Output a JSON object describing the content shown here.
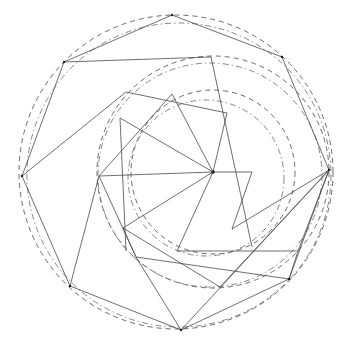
{
  "diagram": {
    "title": "",
    "background": "#ffffff",
    "stroke_color": "#4a4a4a",
    "circles": [
      {
        "name": "outer-circle-dashed",
        "cx": 176,
        "cy": 172,
        "r": 157,
        "style": "dash"
      },
      {
        "name": "outer-circle-dashdot",
        "cx": 179,
        "cy": 175,
        "r": 152,
        "style": "dashdot"
      },
      {
        "name": "middle-circle-dashed",
        "cx": 213,
        "cy": 172,
        "r": 116,
        "style": "dash"
      },
      {
        "name": "middle-circle-dashdot",
        "cx": 210,
        "cy": 175,
        "r": 112,
        "style": "dashdot"
      },
      {
        "name": "inner-circle-dashed",
        "cx": 213,
        "cy": 172,
        "r": 82,
        "style": "dash"
      },
      {
        "name": "inner-circle-dashdot",
        "cx": 206,
        "cy": 178,
        "r": 78,
        "style": "dashdot"
      }
    ],
    "vertices": [
      {
        "name": "center",
        "x": 213,
        "y": 172
      },
      {
        "name": "outer-top",
        "x": 172,
        "y": 15
      },
      {
        "name": "outer-upper-right",
        "x": 282,
        "y": 57
      },
      {
        "name": "outer-right",
        "x": 329,
        "y": 170
      },
      {
        "name": "outer-lower-right",
        "x": 289,
        "y": 279
      },
      {
        "name": "outer-bottom",
        "x": 181,
        "y": 330
      },
      {
        "name": "outer-lower-left",
        "x": 70,
        "y": 286
      },
      {
        "name": "outer-left",
        "x": 22,
        "y": 176
      },
      {
        "name": "outer-upper-left",
        "x": 64,
        "y": 62
      }
    ],
    "segments": [
      [
        22,
        176,
        64,
        62
      ],
      [
        64,
        62,
        172,
        15
      ],
      [
        172,
        15,
        282,
        57
      ],
      [
        282,
        57,
        329,
        170
      ],
      [
        329,
        170,
        289,
        279
      ],
      [
        289,
        279,
        181,
        330
      ],
      [
        181,
        330,
        70,
        286
      ],
      [
        70,
        286,
        22,
        176
      ],
      [
        64,
        62,
        211,
        57
      ],
      [
        211,
        57,
        252,
        247
      ],
      [
        22,
        176,
        126,
        92
      ],
      [
        126,
        92,
        227,
        113
      ],
      [
        227,
        113,
        213,
        172
      ],
      [
        70,
        286,
        99,
        176
      ],
      [
        99,
        176,
        213,
        172
      ],
      [
        213,
        172,
        252,
        172
      ],
      [
        252,
        172,
        232,
        229
      ],
      [
        232,
        229,
        329,
        170
      ],
      [
        120,
        118,
        213,
        172
      ],
      [
        120,
        118,
        126,
        251
      ],
      [
        172,
        94,
        213,
        172
      ],
      [
        172,
        94,
        99,
        176
      ],
      [
        213,
        172,
        123,
        228
      ],
      [
        213,
        172,
        177,
        251
      ],
      [
        123,
        228,
        136,
        257
      ],
      [
        99,
        176,
        136,
        257
      ],
      [
        136,
        257,
        181,
        330
      ],
      [
        177,
        251,
        298,
        251
      ],
      [
        298,
        251,
        329,
        170
      ],
      [
        136,
        257,
        289,
        279
      ],
      [
        123,
        228,
        220,
        287
      ],
      [
        220,
        287,
        329,
        170
      ],
      [
        181,
        330,
        329,
        170
      ],
      [
        298,
        251,
        289,
        279
      ]
    ]
  }
}
